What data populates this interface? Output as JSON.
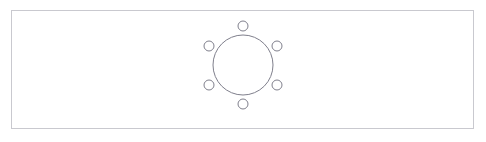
{
  "canvas": {
    "width": 486,
    "height": 142,
    "background_color": "#ffffff"
  },
  "frame": {
    "label": "document-frame",
    "x": 11,
    "y": 10,
    "width": 463,
    "height": 119,
    "stroke_color": "#c9c9cf",
    "stroke_width": 1,
    "fill_color": "#ffffff"
  },
  "diagram": {
    "name": "benzene-ring-structure",
    "stroke_color": "#7f7f8c",
    "fill_color": "#ffffff",
    "center": {
      "x": 243,
      "y": 65
    },
    "core_ring": {
      "label": "core-ring",
      "cx": 243,
      "cy": 65,
      "r": 30,
      "stroke_width": 1
    },
    "substituent_radius": 5,
    "substituent_orbit_radius": 39,
    "substituent_stroke_width": 1,
    "substituents": [
      {
        "label": "node-top",
        "angle_deg": 270,
        "cx": 243,
        "cy": 26
      },
      {
        "label": "node-upper-right",
        "angle_deg": 330,
        "cx": 277,
        "cy": 46
      },
      {
        "label": "node-lower-right",
        "angle_deg": 30,
        "cx": 277,
        "cy": 85
      },
      {
        "label": "node-bottom",
        "angle_deg": 90,
        "cx": 243,
        "cy": 104
      },
      {
        "label": "node-lower-left",
        "angle_deg": 150,
        "cx": 209,
        "cy": 85
      },
      {
        "label": "node-upper-left",
        "angle_deg": 210,
        "cx": 209,
        "cy": 46
      }
    ]
  }
}
